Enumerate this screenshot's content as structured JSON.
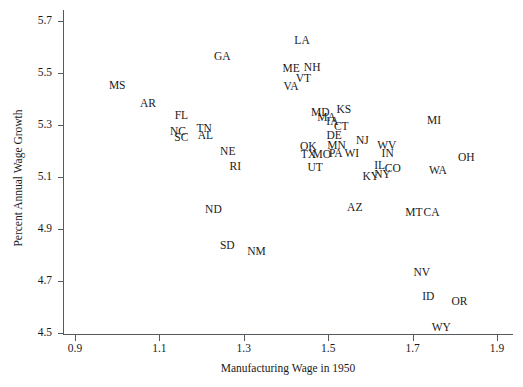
{
  "chart_data": {
    "type": "scatter",
    "title": "",
    "xlabel": "Manufacturing Wage in 1950",
    "ylabel": "Percent Annual Wage Growth",
    "xlim": [
      0.9,
      1.9
    ],
    "ylim": [
      4.5,
      5.7
    ],
    "xticks": [
      "0.9",
      "1.1",
      "1.3",
      "1.5",
      "1.7",
      "1.9"
    ],
    "yticks": [
      "5.7",
      "5.5",
      "5.3",
      "5.1",
      "4.9",
      "4.7",
      "4.5"
    ],
    "grid": false,
    "legend": null,
    "marker_style": "text-label",
    "point_label_field": "label",
    "points": [
      {
        "label": "LA",
        "x": 1.438,
        "y": 5.625
      },
      {
        "label": "GA",
        "x": 1.249,
        "y": 5.562
      },
      {
        "label": "NH",
        "x": 1.462,
        "y": 5.519
      },
      {
        "label": "ME",
        "x": 1.412,
        "y": 5.515
      },
      {
        "label": "VT",
        "x": 1.441,
        "y": 5.477
      },
      {
        "label": "MS",
        "x": 1.0,
        "y": 5.45
      },
      {
        "label": "VA",
        "x": 1.412,
        "y": 5.446
      },
      {
        "label": "AR",
        "x": 1.073,
        "y": 5.381
      },
      {
        "label": "KS",
        "x": 1.537,
        "y": 5.356
      },
      {
        "label": "MD",
        "x": 1.481,
        "y": 5.346
      },
      {
        "label": "FL",
        "x": 1.152,
        "y": 5.333
      },
      {
        "label": "MA",
        "x": 1.496,
        "y": 5.327
      },
      {
        "label": "MI",
        "x": 1.751,
        "y": 5.317
      },
      {
        "label": "IA",
        "x": 1.51,
        "y": 5.31
      },
      {
        "label": "CT",
        "x": 1.531,
        "y": 5.294
      },
      {
        "label": "TN",
        "x": 1.206,
        "y": 5.285
      },
      {
        "label": "NC",
        "x": 1.144,
        "y": 5.272
      },
      {
        "label": "AL",
        "x": 1.209,
        "y": 5.258
      },
      {
        "label": "DE",
        "x": 1.514,
        "y": 5.256
      },
      {
        "label": "SC",
        "x": 1.152,
        "y": 5.25
      },
      {
        "label": "NJ",
        "x": 1.581,
        "y": 5.24
      },
      {
        "label": "WV",
        "x": 1.639,
        "y": 5.221
      },
      {
        "label": "MN",
        "x": 1.52,
        "y": 5.221
      },
      {
        "label": "OK",
        "x": 1.453,
        "y": 5.215
      },
      {
        "label": "NE",
        "x": 1.262,
        "y": 5.196
      },
      {
        "label": "PA",
        "x": 1.518,
        "y": 5.19
      },
      {
        "label": "WI",
        "x": 1.556,
        "y": 5.188
      },
      {
        "label": "IN",
        "x": 1.641,
        "y": 5.188
      },
      {
        "label": "TX",
        "x": 1.453,
        "y": 5.186
      },
      {
        "label": "MO",
        "x": 1.485,
        "y": 5.186
      },
      {
        "label": "OH",
        "x": 1.827,
        "y": 5.173
      },
      {
        "label": "RI",
        "x": 1.28,
        "y": 5.14
      },
      {
        "label": "UT",
        "x": 1.469,
        "y": 5.135
      },
      {
        "label": "IL",
        "x": 1.622,
        "y": 5.144
      },
      {
        "label": "CO",
        "x": 1.653,
        "y": 5.131
      },
      {
        "label": "WA",
        "x": 1.76,
        "y": 5.125
      },
      {
        "label": "KY",
        "x": 1.601,
        "y": 5.1
      },
      {
        "label": "NY",
        "x": 1.629,
        "y": 5.106
      },
      {
        "label": "ND",
        "x": 1.228,
        "y": 4.975
      },
      {
        "label": "AZ",
        "x": 1.563,
        "y": 4.981
      },
      {
        "label": "MT",
        "x": 1.703,
        "y": 4.962
      },
      {
        "label": "CA",
        "x": 1.745,
        "y": 4.962
      },
      {
        "label": "SD",
        "x": 1.261,
        "y": 4.835
      },
      {
        "label": "NM",
        "x": 1.33,
        "y": 4.812
      },
      {
        "label": "NV",
        "x": 1.722,
        "y": 4.731
      },
      {
        "label": "ID",
        "x": 1.737,
        "y": 4.638
      },
      {
        "label": "OR",
        "x": 1.811,
        "y": 4.619
      },
      {
        "label": "WY",
        "x": 1.768,
        "y": 4.519
      }
    ]
  }
}
